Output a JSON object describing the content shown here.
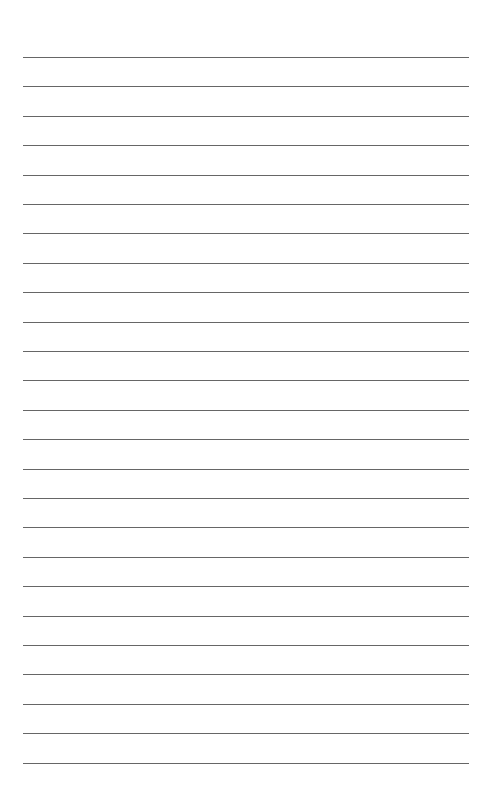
{
  "document": {
    "type": "lined-paper",
    "line_count": 25,
    "first_line_y": 57,
    "line_spacing": 29.4,
    "line_left": 23,
    "line_right": 469,
    "line_color": "#555555",
    "background": "#ffffff"
  }
}
